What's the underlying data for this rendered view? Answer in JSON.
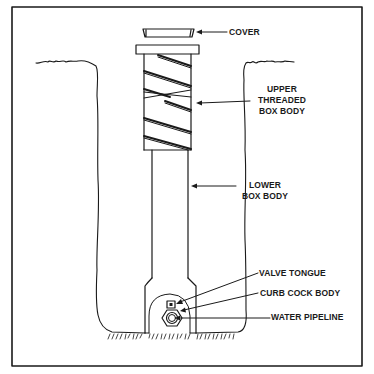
{
  "figure": {
    "colors": {
      "ink": "#1a1a1a",
      "background": "#ffffff"
    }
  },
  "labels": {
    "cover": "COVER",
    "upper_threaded_box_body": [
      "UPPER",
      "THREADED",
      "BOX BODY"
    ],
    "lower_box_body": [
      "LOWER",
      "BOX BODY"
    ],
    "valve_tongue": "VALVE TONGUE",
    "curb_cock_body": "CURB COCK BODY",
    "water_pipeline": "WATER PIPELINE"
  }
}
